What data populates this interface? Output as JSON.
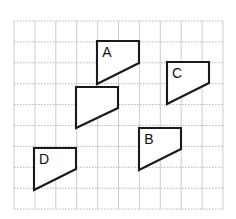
{
  "figure": {
    "canvas": {
      "width": 236,
      "height": 219,
      "background": "#ffffff"
    },
    "grid": {
      "origin_x": 14,
      "origin_y": 21,
      "cell_size": 20.9,
      "columns": 10,
      "rows": 9,
      "vertical_line_color": "#c2c8cd",
      "horizontal_line_color": "#aeb6bd",
      "horizontal_style": "dotted",
      "vertical_style": "solid"
    },
    "shape_style": {
      "stroke_color": "#1a1a1a",
      "fill_color": "#ffffff",
      "stroke_width": 2.1
    },
    "shapes": [
      {
        "id": "shape-a",
        "label": "A",
        "label_x": 107,
        "label_y": 53,
        "points": "97,41 139,41 139,63 97,84",
        "vertices": [
          [
            97,
            41
          ],
          [
            139,
            41
          ],
          [
            139,
            63
          ],
          [
            97,
            84
          ]
        ]
      },
      {
        "id": "shape-unlabeled",
        "label": "",
        "label_x": 0,
        "label_y": 0,
        "points": "76,87 118,87 118,108 76,128",
        "vertices": [
          [
            76,
            87
          ],
          [
            118,
            87
          ],
          [
            118,
            108
          ],
          [
            76,
            128
          ]
        ]
      },
      {
        "id": "shape-c",
        "label": "C",
        "label_x": 177,
        "label_y": 74,
        "points": "167,62 209,62 209,83 167,104",
        "vertices": [
          [
            167,
            62
          ],
          [
            209,
            62
          ],
          [
            209,
            83
          ],
          [
            167,
            104
          ]
        ]
      },
      {
        "id": "shape-b",
        "label": "B",
        "label_x": 149,
        "label_y": 140,
        "points": "139,128 181,128 181,149 139,170",
        "vertices": [
          [
            139,
            128
          ],
          [
            181,
            128
          ],
          [
            181,
            149
          ],
          [
            139,
            170
          ]
        ]
      },
      {
        "id": "shape-d",
        "label": "D",
        "label_x": 44,
        "label_y": 160,
        "points": "34,148 76,148 76,169 34,190",
        "vertices": [
          [
            34,
            148
          ],
          [
            76,
            148
          ],
          [
            76,
            169
          ],
          [
            34,
            190
          ]
        ]
      }
    ]
  }
}
